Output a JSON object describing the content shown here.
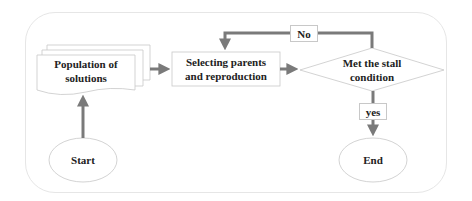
{
  "diagram": {
    "type": "flowchart",
    "nodes": {
      "start": {
        "label": "Start",
        "shape": "ellipse"
      },
      "population": {
        "label_line1": "Population of",
        "label_line2": "solutions",
        "shape": "multi-document"
      },
      "selecting": {
        "label_line1": "Selecting parents",
        "label_line2": "and reproduction",
        "shape": "rectangle"
      },
      "decision": {
        "label_line1": "Met the stall",
        "label_line2": "condition",
        "shape": "diamond"
      },
      "end": {
        "label": "End",
        "shape": "ellipse"
      }
    },
    "edges": {
      "no_label": "No",
      "yes_label": "yes"
    },
    "colors": {
      "arrow": "#7a7a7a",
      "shape_border": "#c8c8c8",
      "frame_border": "#e6e6e6",
      "text": "#222222"
    }
  }
}
